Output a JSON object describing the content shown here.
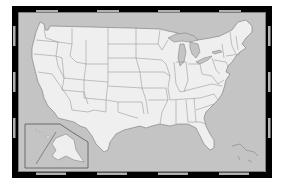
{
  "map": {
    "title": "United States state outline map",
    "colors": {
      "background": "#ffffff",
      "water": "#c4c4c4",
      "land": "#efefef",
      "state_border": "#8a8a8a",
      "coast": "#777777",
      "frame_dark": "#000000",
      "frame_light": "#b0b0b0",
      "inset_border": "#555555"
    },
    "frame": {
      "x": 18,
      "y": 12,
      "width": 248,
      "height": 160,
      "thickness": 5,
      "segments_horizontal": 8,
      "segments_vertical": 6
    },
    "inset": {
      "label": "Alaska and Hawaii inset",
      "x": 25,
      "y": 124
    }
  }
}
